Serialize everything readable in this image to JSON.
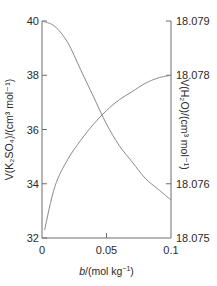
{
  "chart_data": {
    "type": "line",
    "title": "",
    "xlabel": "b/(mol kg⁻¹)",
    "xlabel_parts": {
      "var": "b",
      "rest": "/(mol kg",
      "sup": "−1",
      "close": ")"
    },
    "ylabel_left": "V(K₂SO₄)/(cm³ mol⁻¹)",
    "ylabel_right": "V(H₂O)/(cm³ mol⁻¹)",
    "xlim": [
      0,
      0.1
    ],
    "ylim_left": [
      32,
      40
    ],
    "ylim_right": [
      18.075,
      18.079
    ],
    "x_ticks": [
      "0",
      "0.05",
      "0.1"
    ],
    "y_ticks_left": [
      "40",
      "38",
      "36",
      "34",
      "32"
    ],
    "y_ticks_right": [
      "18.079",
      "18.078",
      "18.076",
      "18.075"
    ],
    "grid": false,
    "legend": null,
    "series": [
      {
        "name": "V(K2SO4)",
        "axis": "left",
        "x": [
          0.002,
          0.01,
          0.02,
          0.03,
          0.04,
          0.05,
          0.06,
          0.07,
          0.08,
          0.09,
          0.1
        ],
        "values": [
          32.3,
          33.9,
          34.9,
          35.6,
          36.2,
          36.7,
          37.1,
          37.4,
          37.7,
          37.9,
          38.0
        ]
      },
      {
        "name": "V(H2O)",
        "axis": "right",
        "x": [
          0,
          0.01,
          0.02,
          0.03,
          0.04,
          0.05,
          0.06,
          0.07,
          0.08,
          0.09,
          0.1
        ],
        "values": [
          18.079,
          18.0789,
          18.0786,
          18.0781,
          18.0776,
          18.0771,
          18.0767,
          18.0764,
          18.0761,
          18.0759,
          18.0757
        ]
      }
    ]
  }
}
